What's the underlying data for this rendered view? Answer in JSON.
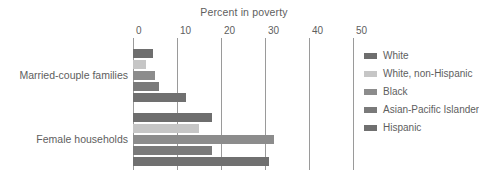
{
  "chart_data": {
    "type": "bar",
    "orientation": "horizontal",
    "title": "Percent in poverty",
    "xlabel": "",
    "ylabel": "",
    "xlim": [
      0,
      50
    ],
    "xticks": [
      0,
      10,
      20,
      30,
      40,
      50
    ],
    "xtick_labels": [
      "0",
      "10",
      "20",
      "30",
      "40",
      "50"
    ],
    "grid": true,
    "grid_axis": "x",
    "legend_position": "right",
    "categories": [
      "Married-couple families",
      "Female households"
    ],
    "series": [
      {
        "name": "White",
        "color": "#6e6e6e",
        "values": [
          4.5,
          18
        ]
      },
      {
        "name": "White, non-Hispanic",
        "color": "#c6c6c6",
        "values": [
          3,
          15
        ]
      },
      {
        "name": "Black",
        "color": "#8c8c8c",
        "values": [
          5,
          32
        ]
      },
      {
        "name": "Asian-Pacific Islander",
        "color": "#7a7a7a",
        "values": [
          6,
          18
        ]
      },
      {
        "name": "Hispanic",
        "color": "#707070",
        "values": [
          12,
          31
        ]
      }
    ]
  },
  "colors": {
    "background": "#ffffff",
    "text": "#5e5e5e",
    "gridline": "#9a9a9a"
  }
}
